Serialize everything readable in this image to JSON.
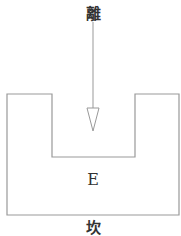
{
  "diagram": {
    "top_label": "離",
    "center_label": "E",
    "bottom_label": "坎",
    "arrow": {
      "direction": "down",
      "style": "hollow-triangle"
    },
    "colors": {
      "stroke": "#999999",
      "text": "#333333"
    }
  }
}
